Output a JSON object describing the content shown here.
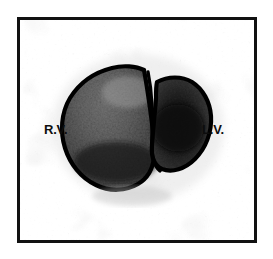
{
  "figure": {
    "kind": "nuclear-medicine-ventriculogram",
    "modality_note": "grayscale radionuclide ventricular scan",
    "frame": {
      "border_color": "#111111",
      "border_width_px": 3,
      "background_color": "#fdfdfd"
    },
    "labels": [
      {
        "id": "rv",
        "text": "R.V.",
        "meaning": "right ventricle",
        "side": "left"
      },
      {
        "id": "lv",
        "text": "L.V.",
        "meaning": "left ventricle",
        "side": "right"
      }
    ],
    "regions": [
      {
        "id": "right-ventricle",
        "label": "R.V.",
        "outline_color": "#000000",
        "fill_tone": "dark-gray",
        "relative_size": "larger"
      },
      {
        "id": "left-ventricle",
        "label": "L.V.",
        "outline_color": "#000000",
        "fill_tone": "very-dark-gray",
        "relative_size": "smaller"
      }
    ],
    "colors": {
      "ink": "#0d0d0d",
      "outline": "#000000",
      "background": "#ffffff",
      "noise_gray": "#b9b9b9",
      "tissue_dark": "#1a1a1a",
      "tissue_mid": "#5c5c5c",
      "tissue_light": "#9a9a9a"
    }
  }
}
